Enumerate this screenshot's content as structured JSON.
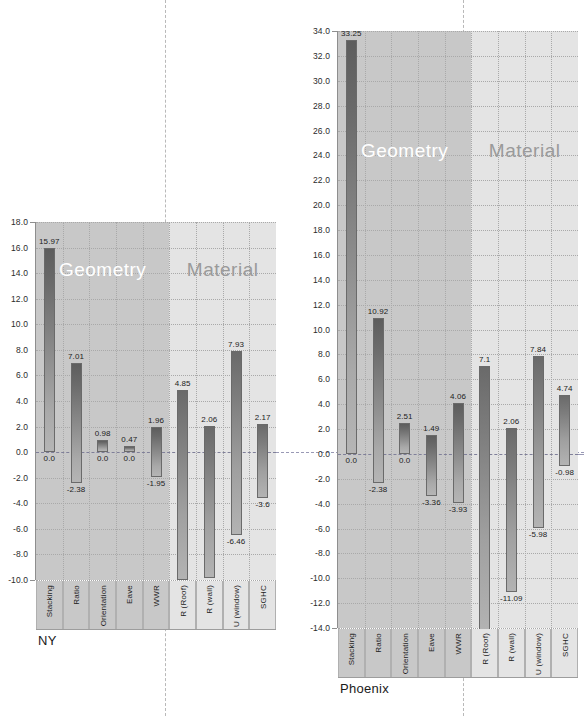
{
  "figure": {
    "separators": [
      {
        "name": "ny-group-separator",
        "x": 165
      },
      {
        "name": "phoenix-group-separator",
        "x": 463
      }
    ]
  },
  "charts": [
    {
      "id": "ny",
      "city_label": "NY",
      "band_labels": {
        "geometry": "Geometry",
        "material": "Material"
      },
      "chart_data": {
        "type": "bar",
        "title": "NY",
        "xlabel": "",
        "ylabel": "",
        "ylim": [
          -10.0,
          18.0
        ],
        "grid": true,
        "legend": "none",
        "yticks": [
          "18.0",
          "16.0",
          "14.0",
          "12.0",
          "10.0",
          "8.0",
          "6.0",
          "4.0",
          "2.0",
          "0.0",
          "-2.0",
          "-4.0",
          "-6.0",
          "-8.0",
          "-10.0"
        ],
        "ytick_values": [
          18,
          16,
          14,
          12,
          10,
          8,
          6,
          4,
          2,
          0,
          -2,
          -4,
          -6,
          -8,
          -10
        ],
        "groups": [
          {
            "name": "Geometry",
            "categories": [
              "Stacking",
              "Ratio",
              "Orientation",
              "Eave",
              "WWR"
            ]
          },
          {
            "name": "Material",
            "categories": [
              "R (Roof)",
              "R (wall)",
              "U (window)",
              "SGHC"
            ]
          }
        ],
        "categories": [
          "Stacking",
          "Ratio",
          "Orientation",
          "Eave",
          "WWR",
          "R (Roof)",
          "R (wall)",
          "U (window)",
          "SGHC"
        ],
        "bars": [
          {
            "category": "Stacking",
            "group": "Geometry",
            "high": 15.97,
            "low": 0.0,
            "high_label": "15.97",
            "low_label": "0.0"
          },
          {
            "category": "Ratio",
            "group": "Geometry",
            "high": 7.01,
            "low": -2.38,
            "high_label": "7.01",
            "low_label": "-2.38"
          },
          {
            "category": "Orientation",
            "group": "Geometry",
            "high": 0.98,
            "low": 0.0,
            "high_label": "0.98",
            "low_label": "0.0"
          },
          {
            "category": "Eave",
            "group": "Geometry",
            "high": 0.47,
            "low": 0.0,
            "high_label": "0.47",
            "low_label": "0.0"
          },
          {
            "category": "WWR",
            "group": "Geometry",
            "high": 1.96,
            "low": -1.95,
            "high_label": "1.96",
            "low_label": "-1.95"
          },
          {
            "category": "R (Roof)",
            "group": "Material",
            "high": 4.85,
            "low": -10.02,
            "high_label": "4.85",
            "low_label": "-10.02"
          },
          {
            "category": "R (wall)",
            "group": "Material",
            "high": 2.06,
            "low": -9.83,
            "high_label": "2.06",
            "low_label": "-9.83"
          },
          {
            "category": "U (window)",
            "group": "Material",
            "high": 7.93,
            "low": -6.46,
            "high_label": "7.93",
            "low_label": "-6.46"
          },
          {
            "category": "SGHC",
            "group": "Material",
            "high": 2.17,
            "low": -3.6,
            "high_label": "2.17",
            "low_label": "-3.6"
          }
        ]
      }
    },
    {
      "id": "phoenix",
      "city_label": "Phoenix",
      "band_labels": {
        "geometry": "Geometry",
        "material": "Material"
      },
      "chart_data": {
        "type": "bar",
        "title": "Phoenix",
        "xlabel": "",
        "ylabel": "",
        "ylim": [
          -14.0,
          34.0
        ],
        "grid": true,
        "legend": "none",
        "yticks": [
          "34.0",
          "32.0",
          "30.0",
          "28.0",
          "26.0",
          "24.0",
          "22.0",
          "20.0",
          "18.0",
          "16.0",
          "14.0",
          "12.0",
          "10.0",
          "8.0",
          "6.0",
          "4.0",
          "2.0",
          "0.0",
          "-2.0",
          "-4.0",
          "-6.0",
          "-8.0",
          "-10.0",
          "-12.0",
          "-14.0"
        ],
        "ytick_values": [
          34,
          32,
          30,
          28,
          26,
          24,
          22,
          20,
          18,
          16,
          14,
          12,
          10,
          8,
          6,
          4,
          2,
          0,
          -2,
          -4,
          -6,
          -8,
          -10,
          -12,
          -14
        ],
        "groups": [
          {
            "name": "Geometry",
            "categories": [
              "Stacking",
              "Ratio",
              "Orientation",
              "Eave",
              "WWR"
            ]
          },
          {
            "name": "Material",
            "categories": [
              "R (Roof)",
              "R (wall)",
              "U (window)",
              "SGHC"
            ]
          }
        ],
        "categories": [
          "Stacking",
          "Ratio",
          "Orientation",
          "Eave",
          "WWR",
          "R (Roof)",
          "R (wall)",
          "U (window)",
          "SGHC"
        ],
        "bars": [
          {
            "category": "Stacking",
            "group": "Geometry",
            "high": 33.25,
            "low": 0.0,
            "high_label": "33.25",
            "low_label": "0.0"
          },
          {
            "category": "Ratio",
            "group": "Geometry",
            "high": 10.92,
            "low": -2.38,
            "high_label": "10.92",
            "low_label": "-2.38"
          },
          {
            "category": "Orientation",
            "group": "Geometry",
            "high": 2.51,
            "low": 0.0,
            "high_label": "2.51",
            "low_label": "0.0"
          },
          {
            "category": "Eave",
            "group": "Geometry",
            "high": 1.49,
            "low": -3.36,
            "high_label": "1.49",
            "low_label": "-3.36"
          },
          {
            "category": "WWR",
            "group": "Geometry",
            "high": 4.06,
            "low": -3.93,
            "high_label": "4.06",
            "low_label": "-3.93"
          },
          {
            "category": "R (Roof)",
            "group": "Material",
            "high": 7.1,
            "low": -14.41,
            "high_label": "7.1",
            "low_label": "-14.41"
          },
          {
            "category": "R (wall)",
            "group": "Material",
            "high": 2.06,
            "low": -11.09,
            "high_label": "2.06",
            "low_label": "-11.09"
          },
          {
            "category": "U (window)",
            "group": "Material",
            "high": 7.84,
            "low": -5.98,
            "high_label": "7.84",
            "low_label": "-5.98"
          },
          {
            "category": "SGHC",
            "group": "Material",
            "high": 4.74,
            "low": -0.98,
            "high_label": "4.74",
            "low_label": "-0.98"
          }
        ]
      }
    }
  ],
  "colors": {
    "band_geometry": "#c8c8c8",
    "band_material": "#e4e4e4",
    "bar_dark": "#5d5d5d",
    "bar_light": "#b5b5b5",
    "grid": "#a9a9a9",
    "zero_line": "#7f7f99",
    "axis": "#8e8e8e",
    "geometry_label": "#ffffff",
    "material_label": "#9a9a9a"
  }
}
